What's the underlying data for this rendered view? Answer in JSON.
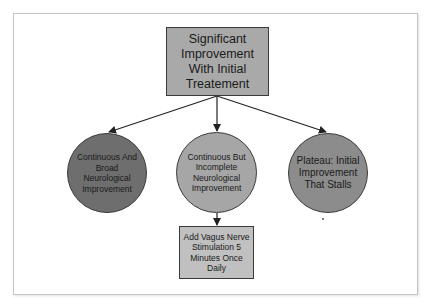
{
  "diagram": {
    "type": "flowchart",
    "colors": {
      "background": "#ffffff",
      "frame_border": "#c4c4c4",
      "root_fill": "#a9a9a9",
      "left_fill": "#6e6e6e",
      "mid_fill": "#a6a6a6",
      "right_fill": "#8c8c8c",
      "bottom_fill": "#c0c0c0",
      "edge": "#222222"
    },
    "nodes": {
      "root": {
        "label": "Significant Improvement With Initial Treatement",
        "shape": "rectangle"
      },
      "left": {
        "label": "Continuous And Broad Neurological Improvement",
        "shape": "circle"
      },
      "mid": {
        "label": "Continuous But Incomplete Neurological Improvement",
        "shape": "circle"
      },
      "right": {
        "label": "Plateau: Initial Improvement That Stalls",
        "shape": "circle"
      },
      "bottom": {
        "label": "Add Vagus Nerve Stimulation 5 Minutes Once Daily",
        "shape": "rectangle"
      }
    },
    "edges": [
      {
        "from": "root",
        "to": "left"
      },
      {
        "from": "root",
        "to": "mid"
      },
      {
        "from": "root",
        "to": "right"
      },
      {
        "from": "mid",
        "to": "bottom"
      }
    ]
  }
}
